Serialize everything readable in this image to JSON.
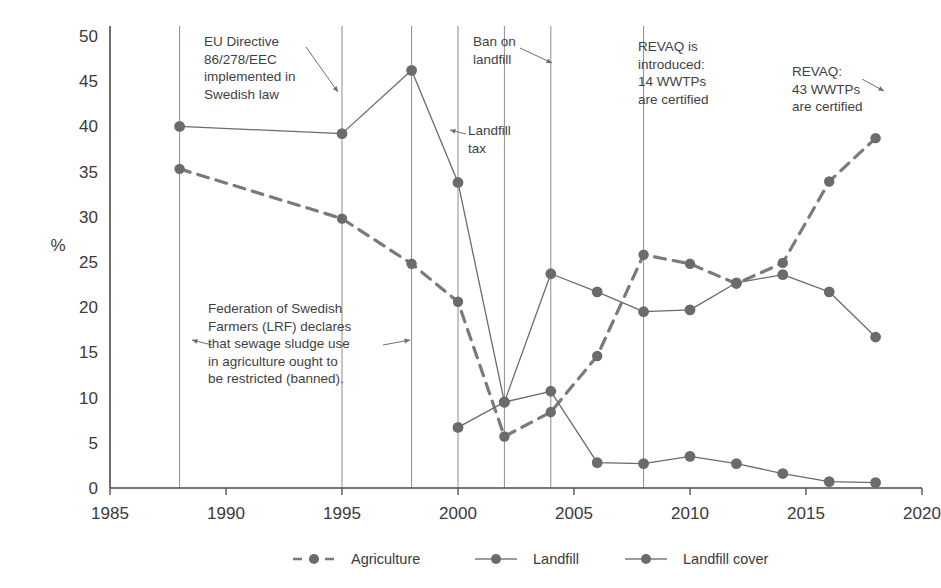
{
  "chart_data": {
    "type": "line",
    "title": "",
    "xlabel": "",
    "ylabel": "%",
    "xlim": [
      1985,
      2020
    ],
    "ylim": [
      0,
      50
    ],
    "ytick_step": 5,
    "xtick_step": 5,
    "xticks": [
      1985,
      1990,
      1995,
      2000,
      2005,
      2010,
      2015,
      2020
    ],
    "yticks": [
      0,
      5,
      10,
      15,
      20,
      25,
      30,
      35,
      40,
      45,
      50
    ],
    "grid": "vertical-event-lines-only",
    "legend_position": "bottom-center",
    "series": [
      {
        "name": "Agriculture",
        "style": "dashed",
        "color": "#7a7a7a",
        "points": [
          {
            "x": 1988,
            "y": 35.3
          },
          {
            "x": 1995,
            "y": 29.8
          },
          {
            "x": 1998,
            "y": 24.8
          },
          {
            "x": 2000,
            "y": 20.6
          },
          {
            "x": 2002,
            "y": 5.7
          },
          {
            "x": 2004,
            "y": 8.4
          },
          {
            "x": 2006,
            "y": 14.6
          },
          {
            "x": 2008,
            "y": 25.8
          },
          {
            "x": 2010,
            "y": 24.8
          },
          {
            "x": 2012,
            "y": 22.6
          },
          {
            "x": 2014,
            "y": 24.9
          },
          {
            "x": 2016,
            "y": 33.9
          },
          {
            "x": 2018,
            "y": 38.7
          }
        ]
      },
      {
        "name": "Landfill",
        "style": "solid",
        "color": "#6b6b6b",
        "points": [
          {
            "x": 1988,
            "y": 40.0
          },
          {
            "x": 1995,
            "y": 39.2
          },
          {
            "x": 1998,
            "y": 46.2
          },
          {
            "x": 2000,
            "y": 33.8
          },
          {
            "x": 2002,
            "y": 9.5
          },
          {
            "x": 2004,
            "y": 23.7
          },
          {
            "x": 2006,
            "y": 21.7
          },
          {
            "x": 2008,
            "y": 19.5
          },
          {
            "x": 2010,
            "y": 19.7
          },
          {
            "x": 2012,
            "y": 22.7
          },
          {
            "x": 2014,
            "y": 23.6
          },
          {
            "x": 2016,
            "y": 21.7
          },
          {
            "x": 2018,
            "y": 16.7
          }
        ]
      },
      {
        "name": "Landfill cover",
        "style": "solid",
        "color": "#6b6b6b",
        "points": [
          {
            "x": 2000,
            "y": 6.7
          },
          {
            "x": 2002,
            "y": 9.5
          },
          {
            "x": 2004,
            "y": 10.7
          },
          {
            "x": 2006,
            "y": 2.8
          },
          {
            "x": 2008,
            "y": 2.7
          },
          {
            "x": 2010,
            "y": 3.5
          },
          {
            "x": 2012,
            "y": 2.7
          },
          {
            "x": 2014,
            "y": 1.6
          },
          {
            "x": 2016,
            "y": 0.7
          },
          {
            "x": 2018,
            "y": 0.6
          }
        ]
      }
    ],
    "event_lines": [
      1988,
      1995,
      1998,
      2000,
      2002,
      2004,
      2008
    ],
    "annotations": [
      {
        "id": "eu-directive",
        "text": "EU Directive\n86/278/EEC\nimplemented in\nSwedish law",
        "x": 204,
        "y": 33,
        "arrow_to_x": 338,
        "arrow_to_y": 92
      },
      {
        "id": "ban-on-landfill",
        "text": "Ban on\nlandfill",
        "x": 473,
        "y": 33,
        "arrow_to_x": 552,
        "arrow_to_y": 63
      },
      {
        "id": "landfill-tax",
        "text": "Landfill\ntax",
        "x": 468,
        "y": 122,
        "arrow_to_x": 450,
        "arrow_to_y": 132
      },
      {
        "id": "revaq-introduced",
        "text": "REVAQ is\nintroduced:\n14 WWTPs\nare certified",
        "x": 638,
        "y": 38,
        "arrow_to_x": 0,
        "arrow_to_y": 0
      },
      {
        "id": "revaq-43",
        "text": "REVAQ:\n43 WWTPs\nare certified",
        "x": 792,
        "y": 63,
        "arrow_to_x": 884,
        "arrow_to_y": 90
      },
      {
        "id": "lrf-declaration",
        "text": "Federation of Swedish\nFarmers (LRF) declares\nthat sewage sludge use\nin agriculture ought to\nbe restricted (banned).",
        "x": 208,
        "y": 300,
        "arrow_to_x": 192,
        "arrow_to_y": 345
      }
    ]
  },
  "legend": {
    "items": [
      {
        "label": "Agriculture",
        "style": "dashed"
      },
      {
        "label": "Landfill",
        "style": "solid"
      },
      {
        "label": "Landfill cover",
        "style": "solid"
      }
    ]
  },
  "colors": {
    "marker": "#6b6b6b",
    "line": "#7a7a7a",
    "axis": "#4a4a4a",
    "event_line": "#8c8c8c",
    "text": "#3a3a3a"
  }
}
